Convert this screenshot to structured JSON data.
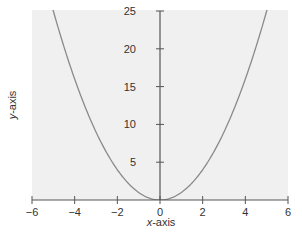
{
  "chart_data": {
    "type": "line",
    "title": "",
    "xlabel_var": "x",
    "xlabel_rest": "-axis",
    "ylabel_var": "y",
    "ylabel_rest": "-axis",
    "function": "y = x^2",
    "xlim": [
      -6,
      6
    ],
    "ylim": [
      0,
      25
    ],
    "grid": false,
    "legend": "none",
    "x_ticks": [
      -6,
      -4,
      -2,
      0,
      2,
      4,
      6
    ],
    "x_tick_labels": [
      "−6",
      "−4",
      "−2",
      "0",
      "2",
      "4",
      "6"
    ],
    "y_ticks": [
      5,
      10,
      15,
      20,
      25
    ],
    "y_tick_labels": [
      "5",
      "10",
      "15",
      "20",
      "25"
    ],
    "series": [
      {
        "name": "y = x^2",
        "color": "#8a8a8a",
        "x": [
          -5,
          -4.5,
          -4,
          -3.5,
          -3,
          -2.5,
          -2,
          -1.5,
          -1,
          -0.5,
          0,
          0.5,
          1,
          1.5,
          2,
          2.5,
          3,
          3.5,
          4,
          4.5,
          5
        ],
        "y": [
          25,
          20.25,
          16,
          12.25,
          9,
          6.25,
          4,
          2.25,
          1,
          0.25,
          0,
          0.25,
          1,
          2.25,
          4,
          6.25,
          9,
          12.25,
          16,
          20.25,
          25
        ]
      }
    ]
  },
  "colors": {
    "plot_background": "#f0f0f0",
    "axis": "#555555",
    "curve": "#8a8a8a",
    "text": "#333333"
  }
}
